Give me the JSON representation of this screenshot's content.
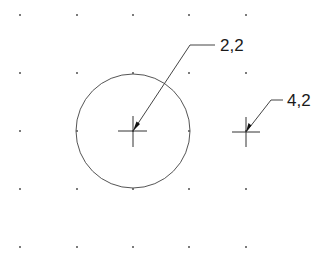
{
  "diagram": {
    "type": "cad-coordinate-grid",
    "grid": {
      "columns_x": [
        20,
        77,
        133,
        189,
        246
      ],
      "rows_y": [
        15,
        73,
        131,
        189,
        247
      ],
      "dot_color": "#333333"
    },
    "circle": {
      "center_label": "2,2",
      "cx": 133,
      "cy": 131,
      "r": 57,
      "stroke": "#555555"
    },
    "points": [
      {
        "id": "point-2-2",
        "label": "2,2",
        "x": 133,
        "y": 131
      },
      {
        "id": "point-4-2",
        "label": "4,2",
        "x": 246,
        "y": 131
      }
    ],
    "leaders": [
      {
        "label": "2,2",
        "tip": [
          133,
          131
        ],
        "elbow": [
          190,
          45
        ],
        "shelf_end": [
          215,
          45
        ],
        "text_x": 220,
        "text_y": 51
      },
      {
        "label": "4,2",
        "tip": [
          246,
          131
        ],
        "elbow": [
          271,
          100
        ],
        "shelf_end": [
          283,
          100
        ],
        "text_x": 287,
        "text_y": 106
      }
    ]
  }
}
